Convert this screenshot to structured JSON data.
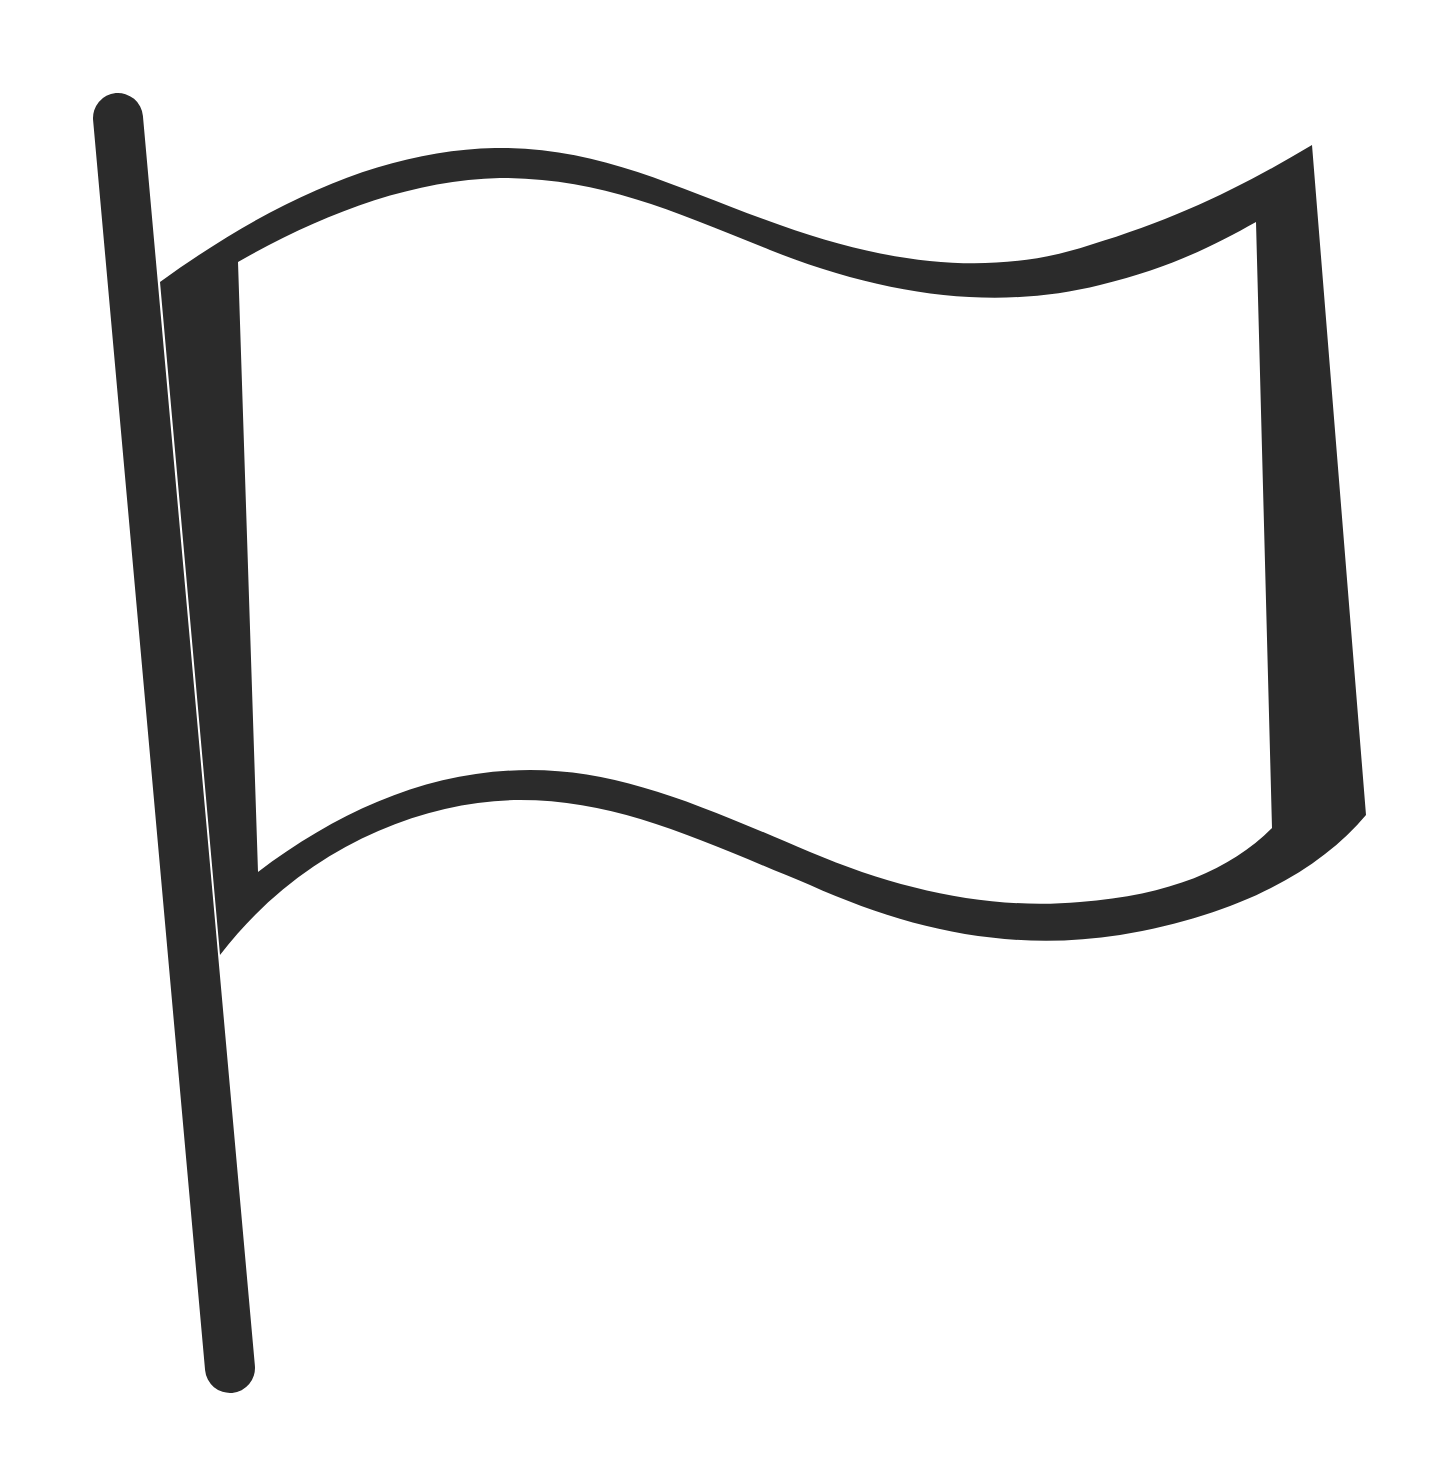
{
  "icon": {
    "name": "flag-icon",
    "style": "outline",
    "colors": {
      "stroke": "#2b2b2b",
      "background": "#ffffff",
      "fill": "#ffffff"
    }
  }
}
